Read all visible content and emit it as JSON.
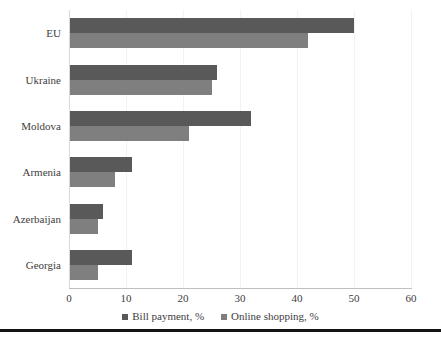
{
  "chart_data": {
    "type": "bar",
    "orientation": "horizontal",
    "title": "",
    "xlabel": "",
    "ylabel": "",
    "xlim": [
      0,
      60
    ],
    "xticks": [
      "0",
      "10",
      "20",
      "30",
      "40",
      "50",
      "60"
    ],
    "grid": true,
    "legend_position": "bottom",
    "categories": [
      "EU",
      "Ukraine",
      "Moldova",
      "Armenia",
      "Azerbaijan",
      "Georgia"
    ],
    "series": [
      {
        "name": "Bill payment, %",
        "color": "#595959",
        "values": [
          50,
          26,
          32,
          11,
          6,
          11
        ]
      },
      {
        "name": "Online shopping, %",
        "color": "#7f7f7f",
        "values": [
          42,
          25,
          21,
          8,
          5,
          5
        ]
      }
    ]
  },
  "axis": {
    "tick_labels": [
      "0",
      "10",
      "20",
      "30",
      "40",
      "50",
      "60"
    ]
  },
  "legend": {
    "items": [
      {
        "label": "Bill payment, %",
        "color": "#595959"
      },
      {
        "label": "Online shopping, %",
        "color": "#7f7f7f"
      }
    ]
  }
}
